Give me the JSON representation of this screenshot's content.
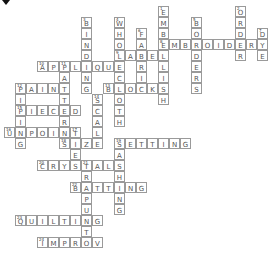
{
  "puzzle": {
    "type": "crossword",
    "cell_size": 11,
    "origin": {
      "x": 4,
      "y": 6
    },
    "words": [
      {
        "num": 1,
        "dir": "down",
        "col": 14,
        "row": 0,
        "answer": "EMBELLISH"
      },
      {
        "num": 2,
        "dir": "down",
        "col": 21,
        "row": 0,
        "answer": "ORDER"
      },
      {
        "num": 3,
        "dir": "down",
        "col": 7,
        "row": 1,
        "answer": "BINDING"
      },
      {
        "num": 4,
        "dir": "down",
        "col": 10,
        "row": 1,
        "answer": "WHOLECLOTH"
      },
      {
        "num": 5,
        "dir": "down",
        "col": 17,
        "row": 1,
        "answer": "BORDERS"
      },
      {
        "num": 6,
        "dir": "down",
        "col": 12,
        "row": 2,
        "answer": "FABRIC"
      },
      {
        "num": 7,
        "dir": "down",
        "col": 23,
        "row": 2,
        "answer": "DYE"
      },
      {
        "num": 8,
        "dir": "across",
        "col": 14,
        "row": 3,
        "answer": "EMBROIDERY"
      },
      {
        "num": 9,
        "dir": "across",
        "col": 10,
        "row": 4,
        "answer": "LABEL"
      },
      {
        "num": 10,
        "dir": "across",
        "col": 3,
        "row": 5,
        "answer": "APPLIQUE"
      },
      {
        "num": 11,
        "dir": "down",
        "col": 5,
        "row": 5,
        "answer": "PATTERN"
      },
      {
        "num": 12,
        "dir": "across",
        "col": 1,
        "row": 7,
        "answer": "PAINT"
      },
      {
        "num": 12,
        "dir": "down",
        "col": 1,
        "row": 7,
        "answer": "PIPING"
      },
      {
        "num": 13,
        "dir": "across",
        "col": 9,
        "row": 7,
        "answer": "BLOCKS"
      },
      {
        "num": 14,
        "dir": "down",
        "col": 8,
        "row": 8,
        "answer": "SCALE"
      },
      {
        "num": 15,
        "dir": "across",
        "col": 1,
        "row": 9,
        "answer": "PIECED"
      },
      {
        "num": 16,
        "dir": "across",
        "col": 0,
        "row": 11,
        "answer": "UNPOINT"
      },
      {
        "num": 17,
        "dir": "down",
        "col": 6,
        "row": 11,
        "answer": "TIES"
      },
      {
        "num": 18,
        "dir": "across",
        "col": 5,
        "row": 12,
        "answer": "SIZE"
      },
      {
        "num": 19,
        "dir": "across",
        "col": 10,
        "row": 12,
        "answer": "SETTING"
      },
      {
        "num": 19,
        "dir": "down",
        "col": 10,
        "row": 12,
        "answer": "SASHING"
      },
      {
        "num": 20,
        "dir": "across",
        "col": 3,
        "row": 14,
        "answer": "CRYSTALS"
      },
      {
        "num": 21,
        "dir": "down",
        "col": 7,
        "row": 14,
        "answer": "TRAPUNTO"
      },
      {
        "num": 22,
        "dir": "across",
        "col": 6,
        "row": 16,
        "answer": "BATTING"
      },
      {
        "num": 23,
        "dir": "across",
        "col": 1,
        "row": 19,
        "answer": "QUILTING"
      },
      {
        "num": 24,
        "dir": "across",
        "col": 3,
        "row": 21,
        "answer": "IMPROV"
      }
    ]
  },
  "icons": {
    "cursor": "cursor-icon"
  },
  "colors": {
    "border": "#9a9a9a",
    "letter": "#555555",
    "background": "#ffffff"
  }
}
